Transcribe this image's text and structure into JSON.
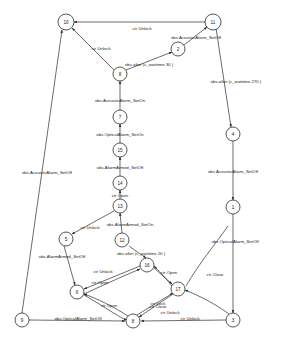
{
  "diagram": {
    "type": "state-transition-graph",
    "node_shape": "circle",
    "colors": {
      "background": "#ffffff",
      "stroke": "#2b2b2b",
      "node_fill": "#ffffff",
      "text": "#1a1a1a"
    },
    "nodes": [
      {
        "id": "n10",
        "label": "10",
        "x": 66,
        "y": 22,
        "r": 8
      },
      {
        "id": "n11",
        "label": "11",
        "x": 213,
        "y": 22,
        "r": 8
      },
      {
        "id": "n2",
        "label": "2",
        "x": 178,
        "y": 49,
        "r": 7
      },
      {
        "id": "n8",
        "label": "8",
        "x": 120,
        "y": 74,
        "r": 7
      },
      {
        "id": "n7",
        "label": "7",
        "x": 120,
        "y": 117,
        "r": 7
      },
      {
        "id": "n15",
        "label": "15",
        "x": 120,
        "y": 150,
        "r": 7
      },
      {
        "id": "n14",
        "label": "14",
        "x": 120,
        "y": 183,
        "r": 7
      },
      {
        "id": "n13",
        "label": "13",
        "x": 120,
        "y": 206,
        "r": 7
      },
      {
        "id": "n12",
        "label": "12",
        "x": 122,
        "y": 240,
        "r": 7
      },
      {
        "id": "n4",
        "label": "4",
        "x": 233,
        "y": 134,
        "r": 7
      },
      {
        "id": "n1",
        "label": "1",
        "x": 233,
        "y": 207,
        "r": 7
      },
      {
        "id": "n5",
        "label": "5",
        "x": 66,
        "y": 239,
        "r": 7
      },
      {
        "id": "n16",
        "label": "16",
        "x": 147,
        "y": 265,
        "r": 7
      },
      {
        "id": "n6",
        "label": "6",
        "x": 77,
        "y": 292,
        "r": 7
      },
      {
        "id": "n17",
        "label": "17",
        "x": 178,
        "y": 289,
        "r": 7
      },
      {
        "id": "n9",
        "label": "9",
        "x": 22,
        "y": 320,
        "r": 7
      },
      {
        "id": "n8b",
        "label": "8",
        "x": 133,
        "y": 321,
        "r": 7
      },
      {
        "id": "n3",
        "label": "3",
        "x": 233,
        "y": 320,
        "r": 7
      }
    ],
    "edge_labels": [
      {
        "id": "l_unlock_top",
        "text": "ctr Unlock",
        "x": 142,
        "y": 28
      },
      {
        "id": "l_acoustic_off_1",
        "text": "obs.AcousticAlarm_SetOff",
        "x": 196,
        "y": 37
      },
      {
        "id": "l_unlock_2",
        "text": "ctr Unlock",
        "x": 101,
        "y": 48
      },
      {
        "id": "l_wait30",
        "text": "obs.after (c_waittime 30 )",
        "x": 149,
        "y": 64
      },
      {
        "id": "l_wait270",
        "text": "obs.after (c_waittime 270 )",
        "x": 236,
        "y": 81
      },
      {
        "id": "l_acoustic_on",
        "text": "obs.AcousticAlarm_SetOn",
        "x": 120,
        "y": 100
      },
      {
        "id": "l_optical_on",
        "text": "obs.OpticalAlarm_SetOn",
        "x": 120,
        "y": 134
      },
      {
        "id": "l_armed_off_1",
        "text": "obs.AlarmArmed_SetOff",
        "x": 120,
        "y": 167
      },
      {
        "id": "l_acoustic_off_2",
        "text": "obs.AcousticAlarm_SetOff",
        "x": 47,
        "y": 172
      },
      {
        "id": "l_acoustic_off_3",
        "text": "obs.AcousticAlarm_SetOff",
        "x": 233,
        "y": 171
      },
      {
        "id": "l_open_1",
        "text": "ctr Open",
        "x": 120,
        "y": 195
      },
      {
        "id": "l_armed_on",
        "text": "obs.AlarmArmed_SetOn",
        "x": 130,
        "y": 224
      },
      {
        "id": "l_unlock_3",
        "text": "ctr Unlock",
        "x": 90,
        "y": 227
      },
      {
        "id": "l_optical_off_1",
        "text": "obs.OpticalAlarm_SetOff",
        "x": 235,
        "y": 241
      },
      {
        "id": "l_armed_off_2",
        "text": "obs.AlarmArmed_SetOff",
        "x": 62,
        "y": 256
      },
      {
        "id": "l_wait20",
        "text": "obs.after (c_waittime 20 )",
        "x": 141,
        "y": 253
      },
      {
        "id": "l_unlock_4",
        "text": "ctr Unlock",
        "x": 103,
        "y": 271
      },
      {
        "id": "l_open_2",
        "text": "ctr Open",
        "x": 169,
        "y": 272
      },
      {
        "id": "l_open_3",
        "text": "ctr Open",
        "x": 100,
        "y": 282
      },
      {
        "id": "l_close_1",
        "text": "ctr Close",
        "x": 215,
        "y": 274
      },
      {
        "id": "l_lock_1",
        "text": "ctr Lock",
        "x": 158,
        "y": 303
      },
      {
        "id": "l_unlock_5",
        "text": "ctr Unlock",
        "x": 170,
        "y": 312
      },
      {
        "id": "l_open_4",
        "text": "ctr Open",
        "x": 109,
        "y": 305
      },
      {
        "id": "l_close_2",
        "text": "ctr Close",
        "x": 158,
        "y": 306
      },
      {
        "id": "l_optical_off_2",
        "text": "obs.OpticalAlarm_SetOff",
        "x": 78,
        "y": 318
      },
      {
        "id": "l_unlock_6",
        "text": "ctr Unlock",
        "x": 190,
        "y": 318
      }
    ]
  }
}
